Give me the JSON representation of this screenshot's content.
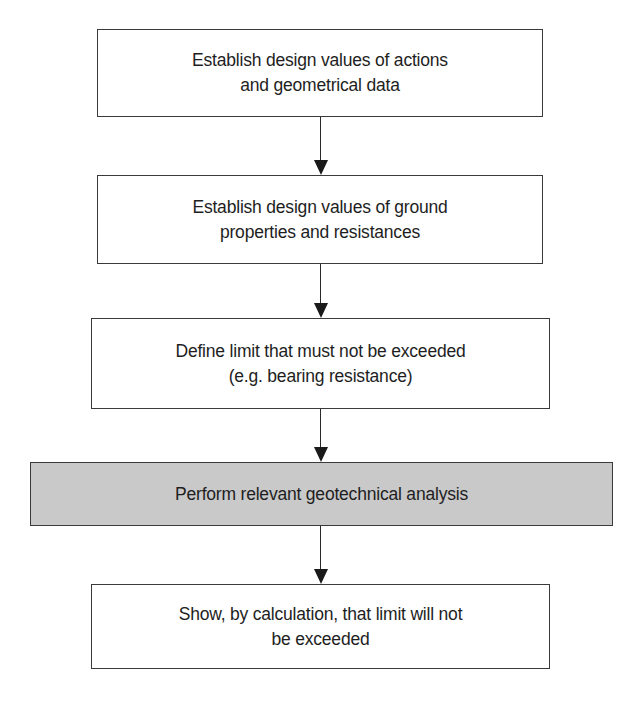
{
  "flowchart": {
    "steps": [
      {
        "id": "step-1",
        "text": "Establish design values of actions\nand geometrical data",
        "shaded": false
      },
      {
        "id": "step-2",
        "text": "Establish design values of ground\nproperties and resistances",
        "shaded": false
      },
      {
        "id": "step-3",
        "text": "Define limit that must not be exceeded\n(e.g. bearing resistance)",
        "shaded": false
      },
      {
        "id": "step-4",
        "text": "Perform relevant geotechnical analysis",
        "shaded": true
      },
      {
        "id": "step-5",
        "text": "Show, by calculation, that limit will not\nbe exceeded",
        "shaded": false
      }
    ],
    "arrows": [
      {
        "from": "step-1",
        "to": "step-2"
      },
      {
        "from": "step-2",
        "to": "step-3"
      },
      {
        "from": "step-3",
        "to": "step-4"
      },
      {
        "from": "step-4",
        "to": "step-5"
      }
    ]
  },
  "colors": {
    "border": "#3a3a3a",
    "shaded_fill": "#c9c9c9",
    "background": "#ffffff",
    "text": "#1e1e1e"
  }
}
